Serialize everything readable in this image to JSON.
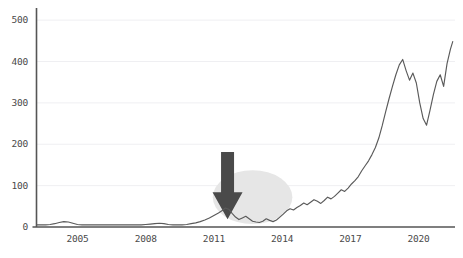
{
  "chart_data": {
    "type": "line",
    "title": "",
    "subtitle": "",
    "xlabel": "",
    "ylabel": "",
    "grid": true,
    "legend": "none",
    "legend_entries": [],
    "xlim": [
      2003.2,
      2021.6
    ],
    "ylim": [
      0,
      510
    ],
    "yticks": [
      0,
      100,
      200,
      300,
      400,
      500
    ],
    "ytick_labels": [
      "0",
      "100",
      "200",
      "300",
      "400",
      "500"
    ],
    "xticks": [
      2005,
      2008,
      2011,
      2014,
      2017,
      2020
    ],
    "xtick_labels": [
      "2005",
      "2008",
      "2011",
      "2014",
      "2017",
      "2020"
    ],
    "series": [
      {
        "name": "value",
        "color": "#5a5a5a",
        "x": [
          2003.2,
          2003.4,
          2003.6,
          2003.8,
          2004.0,
          2004.2,
          2004.4,
          2004.6,
          2004.8,
          2005.0,
          2005.2,
          2005.4,
          2005.6,
          2005.8,
          2006.0,
          2006.2,
          2006.4,
          2006.6,
          2006.8,
          2007.0,
          2007.2,
          2007.4,
          2007.6,
          2007.8,
          2008.0,
          2008.2,
          2008.4,
          2008.6,
          2008.8,
          2009.0,
          2009.2,
          2009.4,
          2009.6,
          2009.8,
          2010.0,
          2010.2,
          2010.4,
          2010.6,
          2010.8,
          2011.0,
          2011.2,
          2011.4,
          2011.5,
          2011.65,
          2011.8,
          2011.95,
          2012.1,
          2012.25,
          2012.4,
          2012.55,
          2012.7,
          2012.85,
          2013.0,
          2013.15,
          2013.3,
          2013.45,
          2013.6,
          2013.75,
          2013.9,
          2014.05,
          2014.2,
          2014.35,
          2014.5,
          2014.65,
          2014.8,
          2014.95,
          2015.1,
          2015.25,
          2015.4,
          2015.55,
          2015.7,
          2015.85,
          2016.0,
          2016.15,
          2016.3,
          2016.45,
          2016.6,
          2016.75,
          2016.9,
          2017.05,
          2017.2,
          2017.35,
          2017.5,
          2017.65,
          2017.8,
          2017.95,
          2018.1,
          2018.25,
          2018.4,
          2018.55,
          2018.7,
          2018.85,
          2019.0,
          2019.15,
          2019.3,
          2019.45,
          2019.6,
          2019.75,
          2019.9,
          2020.05,
          2020.2,
          2020.35,
          2020.5,
          2020.65,
          2020.8,
          2020.95,
          2021.1,
          2021.25,
          2021.4,
          2021.5
        ],
        "y": [
          5,
          5,
          5,
          6,
          8,
          11,
          13,
          12,
          9,
          6,
          5,
          5,
          5,
          5,
          5,
          5,
          5,
          5,
          5,
          5,
          5,
          5,
          5,
          5,
          6,
          7,
          8,
          9,
          8,
          6,
          5,
          5,
          5,
          6,
          8,
          10,
          13,
          17,
          22,
          28,
          34,
          41,
          46,
          43,
          33,
          24,
          18,
          22,
          26,
          20,
          14,
          12,
          11,
          14,
          20,
          16,
          13,
          17,
          24,
          31,
          39,
          44,
          41,
          47,
          52,
          58,
          54,
          60,
          66,
          62,
          57,
          64,
          72,
          68,
          74,
          82,
          90,
          86,
          94,
          104,
          112,
          122,
          136,
          148,
          160,
          175,
          192,
          215,
          245,
          278,
          310,
          340,
          368,
          392,
          405,
          378,
          355,
          372,
          348,
          300,
          262,
          246,
          282,
          320,
          352,
          368,
          340,
          395,
          430,
          448
        ]
      }
    ],
    "annotations": [
      {
        "type": "ellipse-highlight",
        "name": "highlight-ellipse",
        "color": "#e6e6e6",
        "center_x": 2012.7,
        "center_y": 72,
        "width_years": 3.5,
        "height_value": 130
      },
      {
        "type": "arrow",
        "name": "down-arrow",
        "color": "#4a4a4a",
        "points_to_x": 2011.6,
        "points_to_y": 14,
        "direction": "down"
      }
    ]
  },
  "axis": {
    "line_color": "#555555",
    "grid_color": "#efeff2",
    "tick_text_color": "#4a4a4a"
  }
}
